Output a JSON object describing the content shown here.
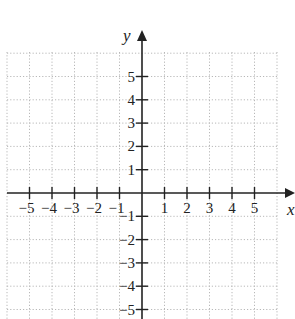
{
  "chart_data": {
    "type": "scatter",
    "title": "",
    "xlabel": "x",
    "ylabel": "y",
    "xlim": [
      -6,
      6
    ],
    "ylim": [
      -5.5,
      6
    ],
    "grid": true,
    "grid_style": "dotted",
    "x_ticks": [
      -5,
      -4,
      -3,
      -2,
      -1,
      1,
      2,
      3,
      4,
      5
    ],
    "y_ticks": [
      5,
      4,
      3,
      2,
      1,
      -1,
      -2,
      -3,
      -4,
      -5
    ],
    "x_tick_labels": [
      "−5",
      "−4",
      "−3",
      "−2",
      "−1",
      "1",
      "2",
      "3",
      "4",
      "5"
    ],
    "y_tick_labels": [
      "5",
      "4",
      "3",
      "2",
      "1",
      "−1",
      "−2",
      "−3",
      "−4",
      "−5"
    ],
    "series": [],
    "legend": null
  },
  "colors": {
    "axis": "#222222",
    "grid": "#b8b8b8",
    "background": "#ffffff"
  }
}
